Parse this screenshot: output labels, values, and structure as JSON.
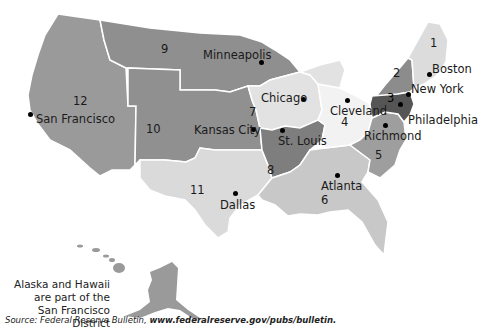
{
  "map": {
    "title": "Federal Reserve Districts",
    "districts": [
      {
        "number": "1",
        "city": "Boston",
        "color": "#dcdcdc"
      },
      {
        "number": "2",
        "city": "New York",
        "color": "#8c8c8c"
      },
      {
        "number": "3",
        "city": "Philadelphia",
        "color": "#555555"
      },
      {
        "number": "4",
        "city": "Cleveland",
        "color": "#f2f2f2"
      },
      {
        "number": "5",
        "city": "Richmond",
        "color": "#9e9e9e"
      },
      {
        "number": "6",
        "city": "Atlanta",
        "color": "#c8c8c8"
      },
      {
        "number": "7",
        "city": "Chicago",
        "color": "#e2e2e2"
      },
      {
        "number": "8",
        "city": "St. Louis",
        "color": "#7e7e7e"
      },
      {
        "number": "9",
        "city": "Minneapolis",
        "color": "#8f8f8f"
      },
      {
        "number": "10",
        "city": "Kansas City",
        "color": "#909090"
      },
      {
        "number": "11",
        "city": "Dallas",
        "color": "#dadada"
      },
      {
        "number": "12",
        "city": "San Francisco",
        "color": "#9a9a9a"
      }
    ],
    "note_line1": "Alaska and Hawaii",
    "note_line2": "are part of the",
    "note_line3": "San Francisco District"
  },
  "source": {
    "prefix": "Source: Federal Reserve Bulletin, ",
    "url": "www.federalreserve.gov/pubs/bulletin."
  }
}
